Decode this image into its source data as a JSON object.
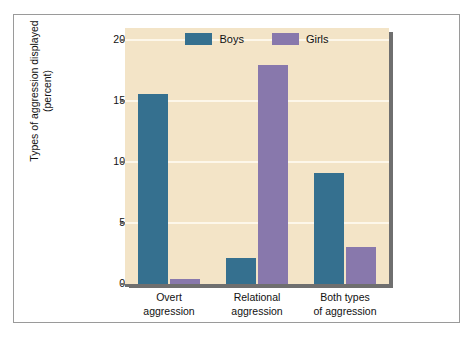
{
  "chart_data": {
    "type": "bar",
    "title": "",
    "subtitle": "",
    "xlabel": "",
    "ylabel": "Types of aggression displayed\n(percent)",
    "ylim": [
      0,
      21
    ],
    "yticks": [
      0,
      5,
      10,
      15,
      20
    ],
    "ytick_labels": [
      "0",
      "5",
      "10",
      "15",
      "20"
    ],
    "grid": true,
    "grid_axis": "y",
    "legend_position": "top-center-inside",
    "categories": [
      "Overt\naggression",
      "Relational\naggression",
      "Both types\nof aggression"
    ],
    "series": [
      {
        "name": "Boys",
        "color": "#35708f",
        "values": [
          15.6,
          2.1,
          9.1
        ]
      },
      {
        "name": "Girls",
        "color": "#8878ac",
        "values": [
          0.4,
          18.0,
          3.0
        ]
      }
    ]
  },
  "colors": {
    "plot_background": "#f3e4c7",
    "page_background": "#ffffff",
    "page_border": "#9a9a9a",
    "gridline": "#fdf7ea",
    "axis_shadow": "#6f6f6f",
    "boys": "#35708f",
    "girls": "#8878ac",
    "text": "#111111"
  },
  "legend": {
    "entries": [
      {
        "label": "Boys",
        "swatch_name": "legend-swatch-boys"
      },
      {
        "label": "Girls",
        "swatch_name": "legend-swatch-girls"
      }
    ]
  }
}
